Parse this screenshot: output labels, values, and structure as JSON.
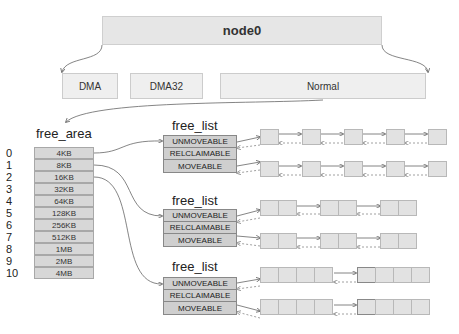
{
  "node": {
    "label": "node0"
  },
  "zones": [
    {
      "label": "DMA"
    },
    {
      "label": "DMA32"
    },
    {
      "label": "Normal"
    }
  ],
  "free_area": {
    "title": "free_area",
    "rows": [
      {
        "order": "0",
        "size": "4KB"
      },
      {
        "order": "1",
        "size": "8KB"
      },
      {
        "order": "2",
        "size": "16KB"
      },
      {
        "order": "3",
        "size": "32KB"
      },
      {
        "order": "4",
        "size": "64KB"
      },
      {
        "order": "5",
        "size": "128KB"
      },
      {
        "order": "6",
        "size": "256KB"
      },
      {
        "order": "7",
        "size": "512KB"
      },
      {
        "order": "8",
        "size": "1MB"
      },
      {
        "order": "9",
        "size": "2MB"
      },
      {
        "order": "10",
        "size": "4MB"
      }
    ]
  },
  "free_lists": [
    {
      "title": "free_list",
      "types": [
        "UNMOVEABLE",
        "RELCLAIMABLE",
        "MOVEABLE"
      ],
      "pages_per_block": 1,
      "blocks": 5
    },
    {
      "title": "free_list",
      "types": [
        "UNMOVEABLE",
        "RELCLAIMABLE",
        "MOVEABLE"
      ],
      "pages_per_block": 2,
      "blocks": 3
    },
    {
      "title": "free_list",
      "types": [
        "UNMOVEABLE",
        "RELCLAIMABLE",
        "MOVEABLE"
      ],
      "pages_per_block": 4,
      "blocks": 2
    }
  ],
  "colors": {
    "node_fill": "#e6e6e6",
    "zone_fill": "#efefef",
    "free_area_fill": "#d7d7d7",
    "free_list_fill": "#cfcfcf",
    "page_fill": "#e2e2e2",
    "arrow": "#666666"
  }
}
